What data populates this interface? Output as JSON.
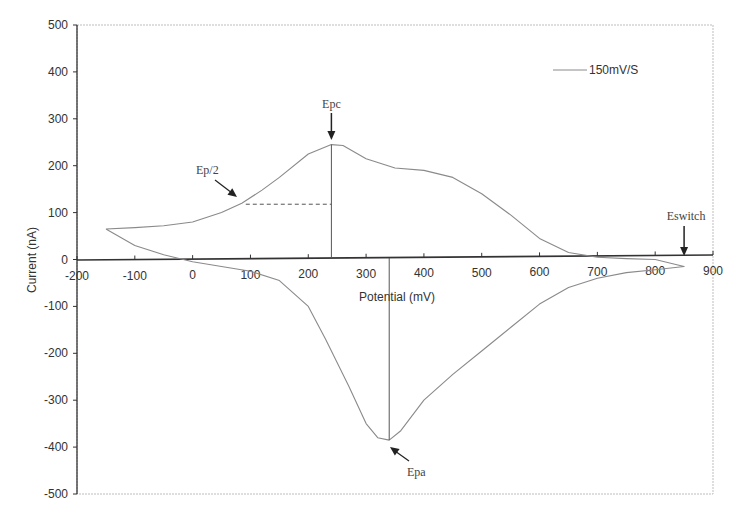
{
  "chart_data": {
    "type": "line",
    "title": "",
    "xlabel": "Potential (mV)",
    "ylabel": "Current (nA)",
    "xlim": [
      -200,
      900
    ],
    "ylim": [
      -500,
      500
    ],
    "x_ticks": [
      -200,
      -100,
      0,
      100,
      200,
      300,
      400,
      500,
      600,
      700,
      800,
      900
    ],
    "y_ticks": [
      500,
      400,
      300,
      200,
      100,
      0,
      -100,
      -200,
      -300,
      -400,
      -500
    ],
    "grid": false,
    "legend": {
      "position": "top-right",
      "entries": [
        "150mV/S"
      ]
    },
    "series": [
      {
        "name": "150mV/S",
        "color": "#8a8a8a",
        "x": [
          -150,
          -100,
          -50,
          0,
          50,
          85,
          120,
          150,
          200,
          240,
          260,
          300,
          350,
          400,
          450,
          500,
          550,
          600,
          650,
          700,
          750,
          800,
          850,
          800,
          750,
          700,
          650,
          600,
          550,
          500,
          450,
          400,
          360,
          340,
          320,
          300,
          270,
          230,
          200,
          150,
          100,
          50,
          0,
          -50,
          -100,
          -150
        ],
        "y": [
          65,
          68,
          72,
          80,
          100,
          120,
          148,
          175,
          225,
          245,
          243,
          215,
          195,
          190,
          175,
          140,
          95,
          45,
          15,
          5,
          2,
          0,
          -15,
          -22,
          -28,
          -40,
          -60,
          -95,
          -145,
          -195,
          -245,
          -300,
          -365,
          -385,
          -380,
          -350,
          -270,
          -170,
          -100,
          -45,
          -25,
          -15,
          -5,
          10,
          30,
          65
        ]
      }
    ],
    "annotations": [
      {
        "text": "Epc",
        "x": 240,
        "y": 245,
        "arrow": "down"
      },
      {
        "text": "Ep/2",
        "x": 85,
        "y": 120,
        "arrow": "down-right",
        "dashed_to_x": 240
      },
      {
        "text": "Epa",
        "x": 340,
        "y": -385,
        "arrow": "up-left"
      },
      {
        "text": "Eswitch",
        "x": 850,
        "y": 0,
        "arrow": "down"
      }
    ]
  },
  "labels": {
    "xlabel": "Potential (mV)",
    "ylabel": "Current (nA)",
    "legend": "150mV/S",
    "epc": "Epc",
    "ep2": "Ep/2",
    "epa": "Epa",
    "eswitch": "Eswitch"
  }
}
